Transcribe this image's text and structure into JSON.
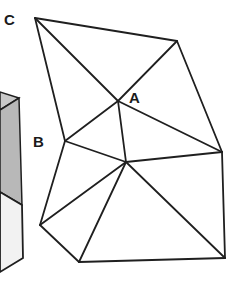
{
  "labels": {
    "c": "C",
    "b": "B",
    "a": "A"
  },
  "colors": {
    "stroke": "#1f1f1f",
    "cube_dark": "#b8b8b8",
    "cube_mid": "#c9c9c9",
    "cube_light": "#f2f2f2",
    "background": "#ffffff"
  },
  "vertices": {
    "top_left": [
      35,
      18
    ],
    "top_right": [
      177,
      41
    ],
    "a": [
      118,
      101
    ],
    "b_left": [
      65,
      141
    ],
    "center": [
      126,
      162
    ],
    "right": [
      222,
      152
    ],
    "bottom_left": [
      40,
      225
    ],
    "bottom_middle": [
      79,
      262
    ],
    "bottom_right": [
      225,
      258
    ]
  }
}
